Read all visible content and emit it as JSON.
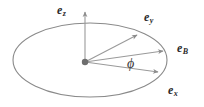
{
  "figure": {
    "background_color": "#ffffff",
    "line_color": "#8c8c8c",
    "ellipse_color": "#8a8a8a",
    "label_color": "#2b2b2b",
    "origin_color": "#6e6e6e",
    "width": 204,
    "height": 107
  },
  "labels": {
    "e_z": {
      "base": "e",
      "sub": "z"
    },
    "e_y": {
      "base": "e",
      "sub": "y"
    },
    "e_B": {
      "base": "e",
      "sub": "B"
    },
    "e_x": {
      "base": "e",
      "sub": "x"
    },
    "phi": "ϕ"
  },
  "geometry": {
    "origin": {
      "x": 85,
      "y": 62
    },
    "ellipse": {
      "cx": 90,
      "cy": 60,
      "rx": 77,
      "ry": 37
    },
    "vectors": [
      {
        "name": "e_z",
        "tip_x": 85,
        "tip_y": 11
      },
      {
        "name": "e_y",
        "tip_x": 140,
        "tip_y": 33
      },
      {
        "name": "e_B",
        "tip_x": 167,
        "tip_y": 50
      },
      {
        "name": "e_x",
        "tip_x": 162,
        "tip_y": 73
      }
    ]
  }
}
